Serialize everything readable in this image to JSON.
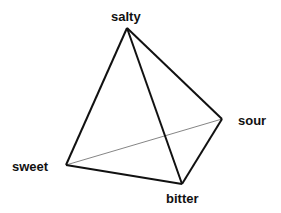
{
  "diagram": {
    "type": "taste-tetrahedron",
    "vertices": {
      "salty": {
        "label": "salty",
        "x": 127,
        "y": 28
      },
      "sweet": {
        "label": "sweet",
        "x": 66,
        "y": 165
      },
      "bitter": {
        "label": "bitter",
        "x": 182,
        "y": 184
      },
      "sour": {
        "label": "sour",
        "x": 222,
        "y": 119
      }
    },
    "edges": [
      {
        "from": "salty",
        "to": "sweet",
        "style": "solid"
      },
      {
        "from": "salty",
        "to": "bitter",
        "style": "solid"
      },
      {
        "from": "salty",
        "to": "sour",
        "style": "solid"
      },
      {
        "from": "sweet",
        "to": "bitter",
        "style": "solid"
      },
      {
        "from": "bitter",
        "to": "sour",
        "style": "solid"
      },
      {
        "from": "sweet",
        "to": "sour",
        "style": "hidden-thin"
      }
    ],
    "colors": {
      "edge": "#111111",
      "hidden_edge": "#777777",
      "background": "#ffffff"
    }
  }
}
